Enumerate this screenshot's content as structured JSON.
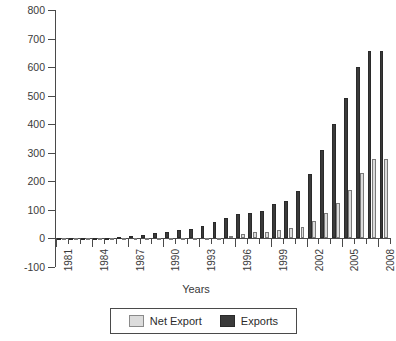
{
  "chart_data": {
    "type": "bar",
    "title": "",
    "subtitle": "",
    "xlabel": "Years",
    "ylabel": "",
    "ylim": [
      -100,
      800
    ],
    "ytick_step": 100,
    "yticks": [
      800,
      700,
      600,
      500,
      400,
      300,
      200,
      100,
      0,
      -100
    ],
    "ytick_labels": [
      "800",
      "700",
      "600",
      "500",
      "400",
      "300",
      "200",
      "100",
      "0",
      "-100"
    ],
    "grid": false,
    "legend_position": "bottom",
    "categories": [
      "1981",
      "1982",
      "1983",
      "1984",
      "1985",
      "1986",
      "1987",
      "1988",
      "1989",
      "1990",
      "1991",
      "1992",
      "1993",
      "1994",
      "1995",
      "1996",
      "1997",
      "1998",
      "1999",
      "2000",
      "2001",
      "2002",
      "2003",
      "2004",
      "2005",
      "2006",
      "2007",
      "2008"
    ],
    "xtick_labels_shown": [
      "1981",
      "1984",
      "1987",
      "1990",
      "1993",
      "1996",
      "1999",
      "2002",
      "2005",
      "2008"
    ],
    "series": [
      {
        "name": "Exports",
        "color": "#3a3a3a",
        "values": [
          1,
          1,
          2,
          2,
          3,
          5,
          8,
          13,
          18,
          22,
          28,
          32,
          44,
          59,
          71,
          85,
          89,
          95,
          122,
          132,
          166,
          226,
          311,
          400,
          492,
          600,
          655,
          655
        ]
      },
      {
        "name": "Net Export",
        "color": "#dcdcdc",
        "values": [
          0,
          0,
          0,
          -1,
          -1,
          -2,
          -3,
          -4,
          -5,
          -6,
          -6,
          -6,
          -5,
          3,
          9,
          15,
          22,
          22,
          29,
          37,
          40,
          60,
          88,
          124,
          171,
          230,
          277,
          277
        ]
      }
    ]
  },
  "legend": {
    "entries": [
      {
        "label": "Net Export",
        "swatch": "net-export-swatch"
      },
      {
        "label": "Exports",
        "swatch": "exports-swatch"
      }
    ]
  },
  "axes": {
    "x_title": "Years"
  }
}
